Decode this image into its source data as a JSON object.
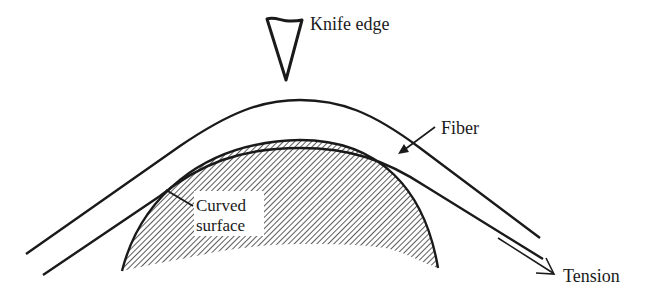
{
  "diagram": {
    "type": "schematic",
    "labels": {
      "knife_edge": "Knife edge",
      "fiber": "Fiber",
      "curved_surface_line1": "Curved",
      "curved_surface_line2": "surface",
      "tension": "Tension"
    },
    "colors": {
      "ink": "#1a1a1a",
      "background": "#ffffff",
      "hatch": "#333333"
    }
  }
}
